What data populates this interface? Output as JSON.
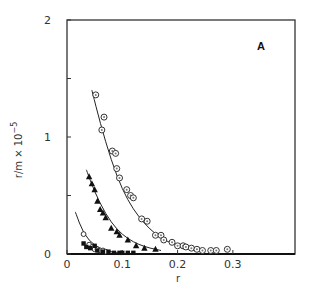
{
  "chart_data": {
    "type": "scatter",
    "title": "",
    "panel_label": "A",
    "xlabel": "r",
    "ylabel": "r/m × 10⁻⁵",
    "xlim": [
      0,
      0.4
    ],
    "ylim": [
      0,
      2
    ],
    "x_ticks": [
      0,
      0.1,
      0.2,
      0.3
    ],
    "x_tick_labels": [
      "0",
      "0.1",
      "0.2",
      "0.3"
    ],
    "y_ticks": [
      0,
      1,
      2
    ],
    "y_tick_labels": [
      "0",
      "1",
      "2"
    ],
    "y_minor_ticks": [
      0.5,
      1.5
    ],
    "grid": false,
    "legend": null,
    "series": [
      {
        "name": "open circles",
        "marker": "open-circle",
        "x": [
          0.052,
          0.067,
          0.063,
          0.082,
          0.088,
          0.09,
          0.095,
          0.108,
          0.115,
          0.12,
          0.135,
          0.145,
          0.16,
          0.17,
          0.175,
          0.19,
          0.2,
          0.21,
          0.215,
          0.225,
          0.235,
          0.245,
          0.26,
          0.27,
          0.29
        ],
        "y": [
          1.36,
          1.17,
          1.06,
          0.88,
          0.86,
          0.73,
          0.65,
          0.55,
          0.5,
          0.48,
          0.3,
          0.28,
          0.16,
          0.16,
          0.12,
          0.1,
          0.07,
          0.07,
          0.06,
          0.05,
          0.04,
          0.03,
          0.03,
          0.03,
          0.04
        ],
        "fit_curve": {
          "x": [
            0.045,
            0.06,
            0.08,
            0.1,
            0.12,
            0.14,
            0.16,
            0.18,
            0.2,
            0.22,
            0.24
          ],
          "y": [
            1.4,
            1.12,
            0.8,
            0.55,
            0.38,
            0.26,
            0.17,
            0.11,
            0.07,
            0.04,
            0.02
          ]
        }
      },
      {
        "name": "filled triangles",
        "marker": "filled-triangle",
        "x": [
          0.04,
          0.045,
          0.05,
          0.055,
          0.06,
          0.065,
          0.07,
          0.08,
          0.09,
          0.095,
          0.11,
          0.125,
          0.14,
          0.16
        ],
        "y": [
          0.66,
          0.6,
          0.55,
          0.45,
          0.38,
          0.35,
          0.31,
          0.22,
          0.19,
          0.16,
          0.12,
          0.07,
          0.05,
          0.04
        ],
        "fit_curve": {
          "x": [
            0.035,
            0.05,
            0.07,
            0.09,
            0.11,
            0.13,
            0.15,
            0.17
          ],
          "y": [
            0.72,
            0.53,
            0.34,
            0.21,
            0.13,
            0.08,
            0.05,
            0.03
          ]
        }
      },
      {
        "name": "open squares / circles (low)",
        "marker": "open-circle-small",
        "x": [
          0.03,
          0.04,
          0.045,
          0.05,
          0.055,
          0.06,
          0.065,
          0.07
        ],
        "y": [
          0.17,
          0.08,
          0.06,
          0.04,
          0.04,
          0.03,
          0.03,
          0.02
        ],
        "fit_curve": {
          "x": [
            0.015,
            0.03,
            0.05,
            0.07,
            0.09,
            0.11
          ],
          "y": [
            0.36,
            0.17,
            0.07,
            0.03,
            0.01,
            0.0
          ]
        }
      },
      {
        "name": "filled squares",
        "marker": "filled-square",
        "x": [
          0.03,
          0.035,
          0.042,
          0.05,
          0.055,
          0.065,
          0.075,
          0.085,
          0.095,
          0.1,
          0.11,
          0.12
        ],
        "y": [
          0.09,
          0.06,
          0.05,
          0.07,
          0.03,
          0.02,
          0.02,
          0.01,
          0.01,
          0.01,
          0.01,
          0.01
        ]
      }
    ]
  },
  "plot_box": {
    "left": 67,
    "top": 20,
    "right": 295,
    "bottom": 254
  },
  "labels": {
    "panel": "A",
    "x_axis": "r",
    "y_axis": "r/m × 10",
    "y_axis_exp": "−5"
  }
}
